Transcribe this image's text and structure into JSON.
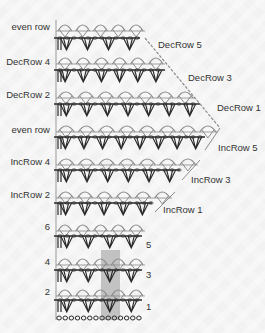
{
  "diagram": {
    "type": "crochet-stitch-chart",
    "colors": {
      "background": "#f2f2f2",
      "arc_stitch": "#8c8c8c",
      "dc_stitch": "#2a2a2a",
      "highlight": "#b0b0b0",
      "label": "#333333"
    },
    "left_labels": [
      {
        "text": "even row",
        "y": 27
      },
      {
        "text": "DecRow 4",
        "y": 62
      },
      {
        "text": "DecRow 2",
        "y": 95
      },
      {
        "text": "even row",
        "y": 130
      },
      {
        "text": "IncRow 4",
        "y": 162
      },
      {
        "text": "IncRow 2",
        "y": 195
      },
      {
        "text": "6",
        "y": 227
      },
      {
        "text": "4",
        "y": 262
      },
      {
        "text": "2",
        "y": 292
      }
    ],
    "right_labels": [
      {
        "text": "DecRow 5",
        "x": 158,
        "y": 45
      },
      {
        "text": "DecRow 3",
        "x": 188,
        "y": 78
      },
      {
        "text": "DecRow 1",
        "x": 217,
        "y": 108
      },
      {
        "text": "IncRow 5",
        "x": 218,
        "y": 148
      },
      {
        "text": "IncRow 3",
        "x": 191,
        "y": 180
      },
      {
        "text": "IncRow 1",
        "x": 163,
        "y": 210
      },
      {
        "text": "5",
        "x": 146,
        "y": 245
      },
      {
        "text": "3",
        "x": 146,
        "y": 275
      },
      {
        "text": "1",
        "x": 146,
        "y": 307
      }
    ],
    "rows": [
      {
        "kind": "arc",
        "y": 27,
        "x_end": 145,
        "repeats": 5
      },
      {
        "kind": "dc",
        "y": 38,
        "x_end": 140,
        "repeats": 4
      },
      {
        "kind": "arc",
        "y": 60,
        "x_end": 165,
        "repeats": 6
      },
      {
        "kind": "dc",
        "y": 70,
        "x_end": 165,
        "repeats": 6
      },
      {
        "kind": "arc",
        "y": 94,
        "x_end": 195,
        "repeats": 7
      },
      {
        "kind": "dc",
        "y": 104,
        "x_end": 200,
        "repeats": 7
      },
      {
        "kind": "arc",
        "y": 128,
        "x_end": 218,
        "repeats": 8
      },
      {
        "kind": "dc",
        "y": 137,
        "x_end": 205,
        "repeats": 8
      },
      {
        "kind": "arc",
        "y": 161,
        "x_end": 198,
        "repeats": 7
      },
      {
        "kind": "dc",
        "y": 170,
        "x_end": 180,
        "repeats": 6
      },
      {
        "kind": "arc",
        "y": 194,
        "x_end": 172,
        "repeats": 6
      },
      {
        "kind": "dc",
        "y": 203,
        "x_end": 152,
        "repeats": 5
      },
      {
        "kind": "arc",
        "y": 227,
        "x_end": 145,
        "repeats": 5
      },
      {
        "kind": "dc",
        "y": 236,
        "x_end": 142,
        "repeats": 4
      },
      {
        "kind": "arc",
        "y": 261,
        "x_end": 145,
        "repeats": 5
      },
      {
        "kind": "dc",
        "y": 270,
        "x_end": 142,
        "repeats": 4
      },
      {
        "kind": "arc",
        "y": 292,
        "x_end": 145,
        "repeats": 5
      },
      {
        "kind": "dc",
        "y": 300,
        "x_end": 142,
        "repeats": 4
      },
      {
        "kind": "chain",
        "y": 318,
        "x_end": 142,
        "count": 14
      }
    ],
    "highlight": {
      "x": 101,
      "y": 250,
      "w": 19,
      "h": 70
    }
  }
}
